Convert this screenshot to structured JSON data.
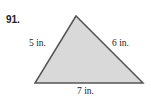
{
  "problem": {
    "number": "91.",
    "sides": {
      "left": "5 in.",
      "right": "6 in.",
      "bottom": "7 in."
    },
    "colors": {
      "fill": "#d9d9d9",
      "stroke": "#555555"
    }
  }
}
